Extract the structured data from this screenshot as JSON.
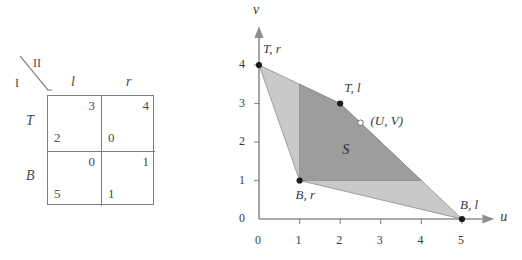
{
  "figure": {
    "players": {
      "row_player": "I",
      "column_player": "II"
    }
  },
  "matrix": {
    "row_player_label": "I",
    "column_player_label": "II",
    "column_headers": [
      "l",
      "r"
    ],
    "row_headers": [
      "T",
      "B"
    ],
    "cells": [
      [
        {
          "p1": "2",
          "p2": "3"
        },
        {
          "p1": "0",
          "p2": "4"
        }
      ],
      [
        {
          "p1": "5",
          "p2": "0"
        },
        {
          "p1": "1",
          "p2": "1"
        }
      ]
    ]
  },
  "chart_data": {
    "type": "scatter",
    "title": "",
    "xlabel": "u",
    "ylabel": "v",
    "xlim": [
      0,
      5.6
    ],
    "ylim": [
      0,
      4.6
    ],
    "xticks": [
      0,
      1,
      2,
      3,
      4,
      5
    ],
    "xticklabels": [
      "0",
      "1",
      "2",
      "3",
      "4",
      "5"
    ],
    "yticks": [
      0,
      1,
      2,
      3,
      4
    ],
    "yticklabels": [
      "0",
      "1",
      "2",
      "3",
      "4"
    ],
    "grid": false,
    "legend": null,
    "points": [
      {
        "name": "T,r",
        "label": "T, r",
        "x": 0,
        "y": 4,
        "marker": "filled"
      },
      {
        "name": "T,l",
        "label": "T, l",
        "x": 2,
        "y": 3,
        "marker": "filled"
      },
      {
        "name": "B,r",
        "label": "B, r",
        "x": 1,
        "y": 1,
        "marker": "filled"
      },
      {
        "name": "B,l",
        "label": "B, l",
        "x": 5,
        "y": 0,
        "marker": "filled"
      },
      {
        "name": "UV",
        "label": "(U, V)",
        "x": 2.5,
        "y": 2.5,
        "marker": "open"
      }
    ],
    "regions": [
      {
        "name": "feasible-hull",
        "label": "",
        "fill": "#c9c9c9",
        "vertices": [
          [
            0,
            4
          ],
          [
            2,
            3
          ],
          [
            5,
            0
          ],
          [
            1,
            1
          ]
        ]
      },
      {
        "name": "bargaining-set-S",
        "label": "S",
        "label_x": 2.05,
        "label_y": 2.0,
        "fill": "#9d9d9d",
        "vertices": [
          [
            1,
            3.5
          ],
          [
            2,
            3
          ],
          [
            4,
            1
          ],
          [
            1,
            1
          ]
        ]
      }
    ],
    "axis_color": "#8f8f8f",
    "point_color": "#1a1a1a"
  }
}
